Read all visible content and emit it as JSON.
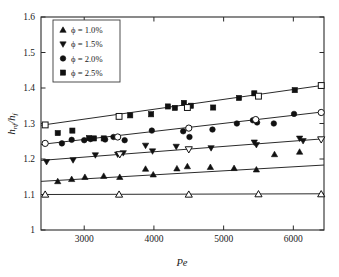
{
  "chart_data": {
    "type": "scatter",
    "title": "",
    "xlabel": "Pe",
    "ylabel": "h_nf/h_f",
    "ylabel_main": "h",
    "ylabel_sub1": "nf",
    "ylabel_sep": "/h",
    "ylabel_sub2": "f",
    "xlim": [
      2380,
      6440
    ],
    "ylim": [
      1.0,
      1.6
    ],
    "xticks": [
      3000,
      4000,
      5000,
      6000
    ],
    "xtick_labels": [
      "3000",
      "4000",
      "5000",
      "6000"
    ],
    "yticks": [
      1.0,
      1.1,
      1.2,
      1.3,
      1.4,
      1.5,
      1.6
    ],
    "ytick_labels": [
      "1",
      "1.1",
      "1.2",
      "1.3",
      "1.4",
      "1.5",
      "1.6"
    ],
    "grid": false,
    "legend_position": "top-left",
    "legend": [
      {
        "label": "ϕ = 1.0%",
        "marker": "triangle-up",
        "filled": true
      },
      {
        "label": "ϕ = 1.5%",
        "marker": "triangle-down",
        "filled": true
      },
      {
        "label": "ϕ = 2.0%",
        "marker": "circle",
        "filled": true
      },
      {
        "label": "ϕ = 2.5%",
        "marker": "square",
        "filled": true
      }
    ],
    "series": [
      {
        "name": "ϕ = 1.0%",
        "marker": "triangle-up",
        "filled": true,
        "trend": {
          "x": [
            2380,
            6440
          ],
          "y": [
            1.137,
            1.183
          ]
        },
        "points": [
          {
            "x": 2620,
            "y": 1.137
          },
          {
            "x": 2820,
            "y": 1.143
          },
          {
            "x": 3010,
            "y": 1.149
          },
          {
            "x": 3280,
            "y": 1.152
          },
          {
            "x": 3510,
            "y": 1.149
          },
          {
            "x": 3880,
            "y": 1.172
          },
          {
            "x": 3990,
            "y": 1.156
          },
          {
            "x": 4330,
            "y": 1.173
          },
          {
            "x": 4480,
            "y": 1.179
          },
          {
            "x": 4810,
            "y": 1.177
          },
          {
            "x": 5150,
            "y": 1.174
          },
          {
            "x": 5470,
            "y": 1.17
          },
          {
            "x": 5730,
            "y": 1.213
          },
          {
            "x": 6090,
            "y": 1.22
          }
        ]
      },
      {
        "name": "ϕ = 1.0% (open)",
        "marker": "triangle-up",
        "filled": false,
        "trend": {
          "x": [
            2380,
            6440
          ],
          "y": [
            1.1,
            1.102
          ]
        },
        "points": [
          {
            "x": 2440,
            "y": 1.1
          },
          {
            "x": 3500,
            "y": 1.1
          },
          {
            "x": 4500,
            "y": 1.1
          },
          {
            "x": 5500,
            "y": 1.101
          },
          {
            "x": 6400,
            "y": 1.101
          }
        ]
      },
      {
        "name": "ϕ = 1.5%",
        "marker": "triangle-down",
        "filled": true,
        "trend": {
          "x": [
            2380,
            6440
          ],
          "y": [
            1.196,
            1.257
          ]
        },
        "points": [
          {
            "x": 2460,
            "y": 1.192
          },
          {
            "x": 2840,
            "y": 1.197
          },
          {
            "x": 3160,
            "y": 1.211
          },
          {
            "x": 3480,
            "y": 1.213
          },
          {
            "x": 3560,
            "y": 1.217
          },
          {
            "x": 3880,
            "y": 1.238
          },
          {
            "x": 3980,
            "y": 1.222
          },
          {
            "x": 4320,
            "y": 1.235
          },
          {
            "x": 4820,
            "y": 1.231
          },
          {
            "x": 5440,
            "y": 1.247
          },
          {
            "x": 5470,
            "y": 1.24
          },
          {
            "x": 6090,
            "y": 1.258
          },
          {
            "x": 6140,
            "y": 1.251
          }
        ]
      },
      {
        "name": "ϕ = 1.5% (open)",
        "marker": "triangle-down",
        "filled": false,
        "trend": {
          "x": [
            2380,
            6440
          ],
          "y": [
            1.196,
            1.257
          ]
        },
        "points": [
          {
            "x": 3510,
            "y": 1.213
          },
          {
            "x": 4500,
            "y": 1.227
          },
          {
            "x": 6400,
            "y": 1.255
          }
        ]
      },
      {
        "name": "ϕ = 2.0%",
        "marker": "circle",
        "filled": true,
        "trend": {
          "x": [
            2380,
            6440
          ],
          "y": [
            1.241,
            1.333
          ]
        },
        "points": [
          {
            "x": 2680,
            "y": 1.244
          },
          {
            "x": 2820,
            "y": 1.254
          },
          {
            "x": 3000,
            "y": 1.253
          },
          {
            "x": 3090,
            "y": 1.256
          },
          {
            "x": 3300,
            "y": 1.255
          },
          {
            "x": 3420,
            "y": 1.262
          },
          {
            "x": 3580,
            "y": 1.253
          },
          {
            "x": 3970,
            "y": 1.28
          },
          {
            "x": 4420,
            "y": 1.278
          },
          {
            "x": 4510,
            "y": 1.262
          },
          {
            "x": 4840,
            "y": 1.283
          },
          {
            "x": 5190,
            "y": 1.3
          },
          {
            "x": 5420,
            "y": 1.309
          },
          {
            "x": 5480,
            "y": 1.303
          },
          {
            "x": 5720,
            "y": 1.3
          },
          {
            "x": 6010,
            "y": 1.327
          }
        ]
      },
      {
        "name": "ϕ = 2.0% (open)",
        "marker": "circle",
        "filled": false,
        "trend": {
          "x": [
            2380,
            6440
          ],
          "y": [
            1.241,
            1.333
          ]
        },
        "points": [
          {
            "x": 2440,
            "y": 1.244
          },
          {
            "x": 3480,
            "y": 1.262
          },
          {
            "x": 4500,
            "y": 1.287
          },
          {
            "x": 5460,
            "y": 1.311
          },
          {
            "x": 6400,
            "y": 1.331
          }
        ]
      },
      {
        "name": "ϕ = 2.5%",
        "marker": "square",
        "filled": true,
        "trend": {
          "x": [
            2380,
            6440
          ],
          "y": [
            1.295,
            1.408
          ]
        },
        "points": [
          {
            "x": 2620,
            "y": 1.273
          },
          {
            "x": 2830,
            "y": 1.28
          },
          {
            "x": 3070,
            "y": 1.259
          },
          {
            "x": 3140,
            "y": 1.258
          },
          {
            "x": 3280,
            "y": 1.258
          },
          {
            "x": 3660,
            "y": 1.323
          },
          {
            "x": 3960,
            "y": 1.326
          },
          {
            "x": 4200,
            "y": 1.348
          },
          {
            "x": 4300,
            "y": 1.344
          },
          {
            "x": 4430,
            "y": 1.358
          },
          {
            "x": 4530,
            "y": 1.35
          },
          {
            "x": 4850,
            "y": 1.345
          },
          {
            "x": 5220,
            "y": 1.372
          },
          {
            "x": 5440,
            "y": 1.385
          },
          {
            "x": 6020,
            "y": 1.394
          }
        ]
      },
      {
        "name": "ϕ = 2.5% (open)",
        "marker": "square",
        "filled": false,
        "trend": {
          "x": [
            2380,
            6440
          ],
          "y": [
            1.295,
            1.408
          ]
        },
        "points": [
          {
            "x": 2440,
            "y": 1.296
          },
          {
            "x": 3500,
            "y": 1.32
          },
          {
            "x": 4480,
            "y": 1.345
          },
          {
            "x": 5500,
            "y": 1.377
          },
          {
            "x": 6400,
            "y": 1.407
          }
        ]
      }
    ]
  }
}
